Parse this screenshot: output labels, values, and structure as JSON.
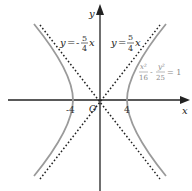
{
  "diagram": {
    "type": "hyperbola-graph",
    "axes": {
      "x_label": "x",
      "y_label": "y",
      "origin_label": "O"
    },
    "ticks": {
      "left_vertex": "-4",
      "right_vertex": "4"
    },
    "asymptotes": [
      {
        "label_lhs": "y",
        "label_eq": "=",
        "sign": "-",
        "num": "5",
        "den": "4",
        "var": "x"
      },
      {
        "label_lhs": "y",
        "label_eq": "=",
        "sign": "",
        "num": "5",
        "den": "4",
        "var": "x"
      }
    ],
    "equation": {
      "t1_num": "x²",
      "t1_den": "16",
      "minus": "-",
      "t2_num": "y²",
      "t2_den": "25",
      "rhs": "= 1"
    },
    "colors": {
      "axis": "#222222",
      "curve": "#9a9a9a",
      "asymptote": "#222222",
      "equation_text": "#8a8a8a"
    }
  }
}
